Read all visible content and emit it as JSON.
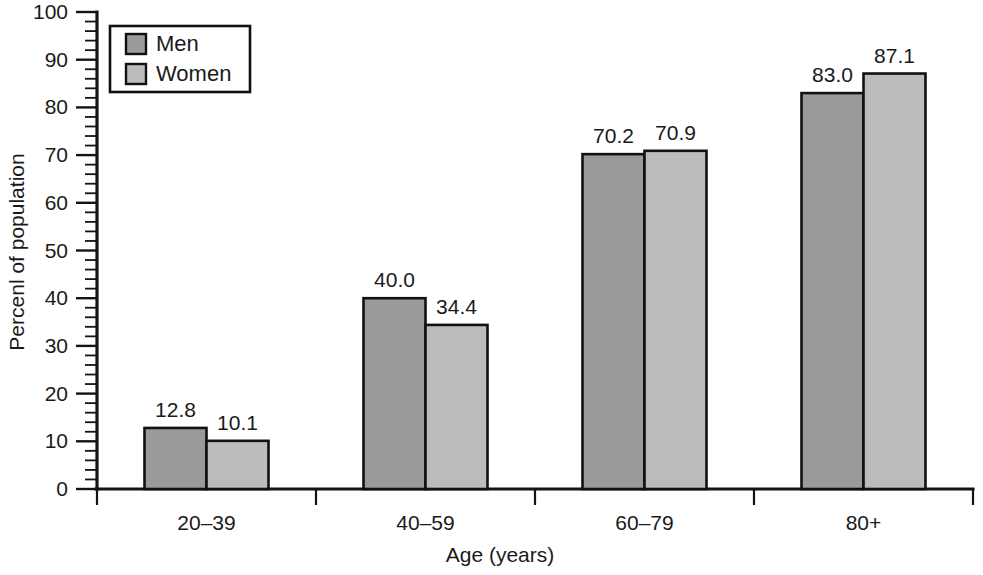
{
  "chart_data": {
    "type": "bar",
    "title": "",
    "subtitle": "",
    "xlabel": "Age (years)",
    "ylabel": "Percenl of population",
    "categories": [
      "20–39",
      "40–59",
      "60–79",
      "80+"
    ],
    "series": [
      {
        "name": "Men",
        "color": "#9a9a9a",
        "values": [
          12.8,
          10.1,
          40.0,
          34.4
        ],
        "labels": [
          "12.8",
          "40.0",
          "70.2",
          "83.0"
        ],
        "values_by_category": [
          12.8,
          40.0,
          70.2,
          83.0
        ]
      },
      {
        "name": "Women",
        "color": "#bcbcbc",
        "values": [
          10.1,
          34.4,
          70.9,
          87.1
        ],
        "labels": [
          "10.1",
          "34.4",
          "70.9",
          "87.1"
        ],
        "values_by_category": [
          10.1,
          34.4,
          70.9,
          87.1
        ]
      }
    ],
    "ylim": [
      0,
      100
    ],
    "ytick_values": [
      0,
      10,
      20,
      30,
      40,
      50,
      60,
      70,
      80,
      90,
      100
    ],
    "ytick_labels": [
      "0",
      "10",
      "20",
      "30",
      "40",
      "50",
      "60",
      "70",
      "80",
      "90",
      "100"
    ],
    "yminor_step": 2,
    "grid": false,
    "legend": {
      "position": "top-left",
      "entries": [
        {
          "label": "Men",
          "color": "#9a9a9a"
        },
        {
          "label": "Women",
          "color": "#bcbcbc"
        }
      ]
    },
    "colors": {
      "men": "#9a9a9a",
      "women": "#bcbcbc",
      "outline": "#111111",
      "axis": "#141414",
      "text": "#1a1a1a",
      "background": "#ffffff"
    }
  }
}
